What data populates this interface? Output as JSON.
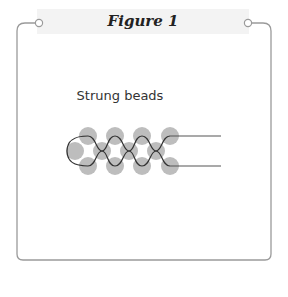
{
  "figure": {
    "title": "Figure 1",
    "label": "Strung beads",
    "colors": {
      "frame": "#9a9a9a",
      "header_bg": "#f3f3f3",
      "bead": "#bdbdbd",
      "thread": "#333333"
    },
    "beads": {
      "top_row": [
        [
          88,
          136
        ],
        [
          115,
          136
        ],
        [
          142,
          136
        ],
        [
          170,
          136
        ]
      ],
      "middle_row": [
        [
          75,
          151
        ],
        [
          102,
          151
        ],
        [
          129,
          151
        ],
        [
          156,
          151
        ]
      ],
      "bottom_row": [
        [
          88,
          166
        ],
        [
          115,
          166
        ],
        [
          142,
          166
        ],
        [
          170,
          166
        ]
      ],
      "radius": 9
    },
    "thread_tails": {
      "top": {
        "x1": 170,
        "y": 136,
        "x2": 221
      },
      "bottom": {
        "x1": 170,
        "y": 166,
        "x2": 221
      }
    }
  }
}
